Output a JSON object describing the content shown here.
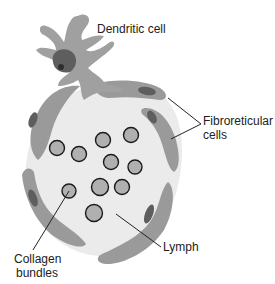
{
  "labels": {
    "dendritic": "Dendritic cell",
    "fibro_1": "Fibroreticular",
    "fibro_2": "cells",
    "collagen_1": "Collagen",
    "collagen_2": "bundles",
    "lymph": "Lymph"
  },
  "colors": {
    "background": "#ffffff",
    "lymph_fill": "#ebebeb",
    "cell_body": "#9a9a9a",
    "cell_light": "#a8a8a8",
    "nucleus": "#5e5e5e",
    "nucleolus": "#2e2e2e",
    "collagen_fill": "#b0b0b0",
    "outline": "#1a1a1a"
  },
  "collagen_bundles": [
    {
      "cx": 57,
      "cy": 148,
      "r": 7.5
    },
    {
      "cx": 79,
      "cy": 154,
      "r": 7.5
    },
    {
      "cx": 103,
      "cy": 140,
      "r": 7.5
    },
    {
      "cx": 131,
      "cy": 135,
      "r": 7.5
    },
    {
      "cx": 111,
      "cy": 162,
      "r": 7.5
    },
    {
      "cx": 135,
      "cy": 167,
      "r": 7
    },
    {
      "cx": 100,
      "cy": 187,
      "r": 8.5
    },
    {
      "cx": 122,
      "cy": 187,
      "r": 7.5
    },
    {
      "cx": 69,
      "cy": 191,
      "r": 7
    },
    {
      "cx": 94,
      "cy": 213,
      "r": 8.5
    }
  ]
}
